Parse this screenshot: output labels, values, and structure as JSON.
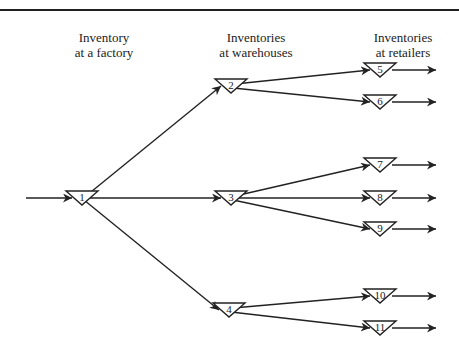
{
  "header": {
    "col1": [
      "Inventory",
      "at a factory"
    ],
    "col2": [
      "Inventories",
      "at warehouses"
    ],
    "col3": [
      "Inventories",
      "at retailers"
    ]
  },
  "nodes": [
    {
      "id": "1",
      "x": 82,
      "y": 198
    },
    {
      "id": "2",
      "x": 231,
      "y": 86
    },
    {
      "id": "3",
      "x": 231,
      "y": 198
    },
    {
      "id": "4",
      "x": 229,
      "y": 310
    },
    {
      "id": "5",
      "x": 380,
      "y": 70
    },
    {
      "id": "6",
      "x": 380,
      "y": 102
    },
    {
      "id": "7",
      "x": 380,
      "y": 165
    },
    {
      "id": "8",
      "x": 380,
      "y": 198
    },
    {
      "id": "9",
      "x": 380,
      "y": 229
    },
    {
      "id": "10",
      "x": 380,
      "y": 296
    },
    {
      "id": "11",
      "x": 380,
      "y": 328
    }
  ],
  "edges": [
    [
      "in",
      "1"
    ],
    [
      "1",
      "2"
    ],
    [
      "1",
      "3"
    ],
    [
      "1",
      "4"
    ],
    [
      "2",
      "5"
    ],
    [
      "2",
      "6"
    ],
    [
      "3",
      "7"
    ],
    [
      "3",
      "8"
    ],
    [
      "3",
      "9"
    ],
    [
      "4",
      "10"
    ],
    [
      "4",
      "11"
    ],
    [
      "5",
      "out"
    ],
    [
      "6",
      "out"
    ],
    [
      "7",
      "out"
    ],
    [
      "8",
      "out"
    ],
    [
      "9",
      "out"
    ],
    [
      "10",
      "out"
    ],
    [
      "11",
      "out"
    ]
  ]
}
